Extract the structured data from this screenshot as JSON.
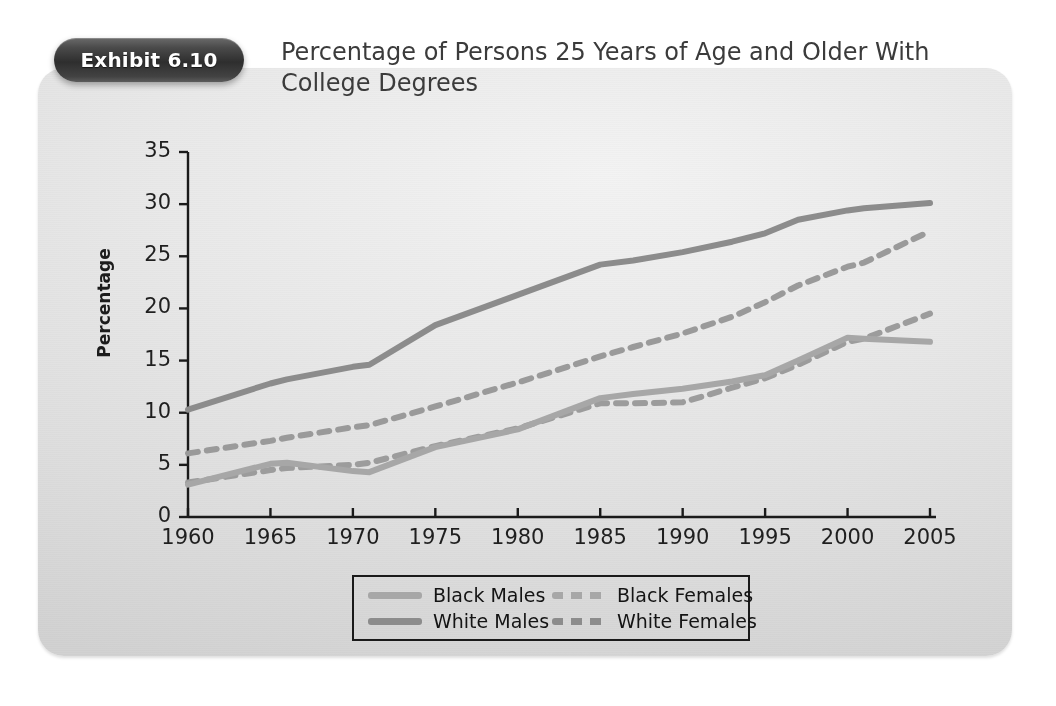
{
  "exhibit": {
    "badge_label": "Exhibit 6.10",
    "title": "Percentage of Persons 25 Years of Age and Older With\nCollege Degrees"
  },
  "colors": {
    "panel_background": "#e4e4e4",
    "badge_background": "#2e2e2e",
    "axis": "#1a1a1a",
    "white_males": "#8c8c8c",
    "white_females": "#9a9a9a",
    "black_males": "#a7a7a7",
    "black_females": "#9c9c9c",
    "title_text": "#3b3b3b"
  },
  "chart_data": {
    "type": "line",
    "title": "Percentage of Persons 25 Years of Age and Older With College Degrees",
    "xlabel": "",
    "ylabel": "Percentage",
    "xlim": [
      1960,
      2005
    ],
    "ylim": [
      0,
      35
    ],
    "xticks": [
      "1960",
      "1965",
      "1970",
      "1975",
      "1980",
      "1985",
      "1990",
      "1995",
      "2000",
      "2005"
    ],
    "yticks": [
      "0",
      "5",
      "10",
      "15",
      "20",
      "25",
      "30",
      "35"
    ],
    "grid": false,
    "legend_position": "bottom",
    "x": [
      1960,
      1965,
      1966,
      1970,
      1971,
      1975,
      1980,
      1985,
      1987,
      1990,
      1993,
      1995,
      1997,
      2000,
      2001,
      2005
    ],
    "series": [
      {
        "name": "White Males",
        "style": "solid",
        "color": "#8c8c8c",
        "values": [
          10.3,
          12.8,
          13.2,
          14.4,
          14.6,
          18.4,
          21.3,
          24.2,
          24.6,
          25.4,
          26.4,
          27.2,
          28.5,
          29.4,
          29.6,
          30.1
        ]
      },
      {
        "name": "White Females",
        "style": "dashed",
        "color": "#9a9a9a",
        "values": [
          6.1,
          7.3,
          7.6,
          8.6,
          8.8,
          10.6,
          12.9,
          15.4,
          16.3,
          17.6,
          19.2,
          20.6,
          22.2,
          24.0,
          24.4,
          27.4
        ]
      },
      {
        "name": "Black Females",
        "style": "dashed",
        "color": "#9c9c9c",
        "values": [
          3.3,
          4.5,
          4.7,
          5.0,
          5.2,
          6.8,
          8.5,
          10.9,
          10.9,
          11.0,
          12.4,
          13.3,
          14.6,
          16.8,
          17.1,
          19.5
        ]
      },
      {
        "name": "Black Males",
        "style": "solid",
        "color": "#a7a7a7",
        "values": [
          3.1,
          5.1,
          5.2,
          4.4,
          4.3,
          6.7,
          8.4,
          11.4,
          11.8,
          12.3,
          13.0,
          13.6,
          15.0,
          17.2,
          17.1,
          16.8
        ]
      }
    ],
    "legend": [
      {
        "label": "Black Males",
        "style": "solid",
        "color": "#a7a7a7"
      },
      {
        "label": "Black Females",
        "style": "dashed",
        "color": "#9c9c9c"
      },
      {
        "label": "White Males",
        "style": "solid",
        "color": "#8c8c8c"
      },
      {
        "label": "White Females",
        "style": "dashed",
        "color": "#9a9a9a"
      }
    ]
  }
}
